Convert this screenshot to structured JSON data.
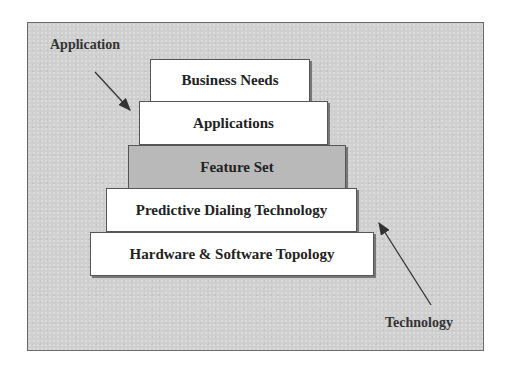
{
  "diagram": {
    "labels": {
      "top_left": "Application",
      "bottom_right": "Technology"
    },
    "steps": [
      {
        "label": "Business Needs",
        "fill": "#ffffff"
      },
      {
        "label": "Applications",
        "fill": "#ffffff"
      },
      {
        "label": "Feature Set",
        "fill": "#b9b9b9"
      },
      {
        "label": "Predictive Dialing Technology",
        "fill": "#ffffff"
      },
      {
        "label": "Hardware & Software Topology",
        "fill": "#ffffff"
      }
    ],
    "colors": {
      "background": "#cfcfcf",
      "step_white": "#ffffff",
      "step_gray": "#b9b9b9",
      "text": "#222222"
    }
  }
}
